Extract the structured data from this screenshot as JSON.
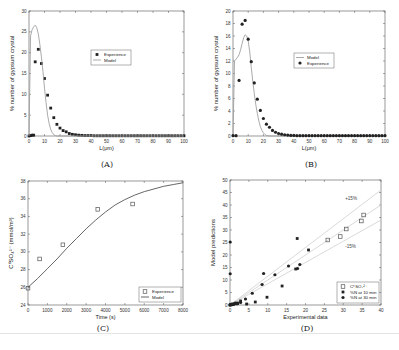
{
  "figure": {
    "captions": [
      "(A)",
      "(B)",
      "(C)",
      "(D)"
    ]
  },
  "chart_data": [
    {
      "id": "A",
      "type": "scatter",
      "title": "",
      "xlabel": "L(μm)",
      "ylabel": "% number of gypsum crystal",
      "xlim": [
        0,
        100
      ],
      "ylim": [
        0,
        30
      ],
      "xticks": [
        0,
        10,
        20,
        30,
        40,
        50,
        60,
        70,
        80,
        90,
        100
      ],
      "yticks": [
        0,
        5,
        10,
        15,
        20,
        25,
        30
      ],
      "grid": false,
      "legend": {
        "position": "center-right",
        "entries": [
          "Experience",
          "Model"
        ]
      },
      "series": [
        {
          "name": "Experience",
          "kind": "marker",
          "marker": "square",
          "x": [
            0,
            1,
            2,
            3,
            4,
            6,
            8,
            10,
            12,
            14,
            16,
            18,
            20,
            22,
            24,
            26,
            28,
            30,
            32,
            34,
            36,
            38,
            40,
            42,
            44,
            46,
            48,
            50,
            52,
            54,
            56,
            58,
            60,
            62,
            64,
            66,
            68,
            70,
            72,
            74,
            76,
            78,
            80,
            82,
            84,
            86,
            88,
            90,
            92,
            94,
            96,
            98,
            100
          ],
          "y": [
            0,
            0.1,
            0.2,
            0.2,
            17.8,
            20.8,
            17.4,
            13.8,
            9.8,
            6.7,
            4.4,
            2.8,
            1.9,
            1.3,
            1.0,
            0.6,
            0.4,
            0.3,
            0.2,
            0.15,
            0.1,
            0.1,
            0.1,
            0.05,
            0.05,
            0.05,
            0.05,
            0.05,
            0.05,
            0.05,
            0.05,
            0.05,
            0.05,
            0.05,
            0.05,
            0.05,
            0.05,
            0.05,
            0.05,
            0.05,
            0.05,
            0.05,
            0.05,
            0.05,
            0.05,
            0.05,
            0.05,
            0.05,
            0.05,
            0.05,
            0.05,
            0.05,
            0.05
          ]
        },
        {
          "name": "Model",
          "kind": "line",
          "x": [
            0,
            1,
            2,
            3,
            4,
            5,
            6,
            7,
            8,
            9,
            10,
            11,
            12,
            13,
            14,
            15,
            16,
            17,
            18,
            20,
            25,
            30,
            100
          ],
          "y": [
            0,
            24,
            25.5,
            26.2,
            26.6,
            26.0,
            24.5,
            22,
            19,
            15.5,
            11.5,
            8,
            5,
            3,
            1.6,
            0.8,
            0.3,
            0.1,
            0,
            0,
            0,
            0,
            0
          ]
        }
      ]
    },
    {
      "id": "B",
      "type": "scatter",
      "title": "",
      "xlabel": "L(μm)",
      "ylabel": "% number of gypsum crystal",
      "xlim": [
        0,
        100
      ],
      "ylim": [
        0,
        20
      ],
      "xticks": [
        0,
        10,
        20,
        30,
        40,
        50,
        60,
        70,
        80,
        90,
        100
      ],
      "yticks": [
        0,
        2,
        4,
        6,
        8,
        10,
        12,
        14,
        16,
        18,
        20
      ],
      "grid": false,
      "legend": {
        "position": "center-right",
        "entries": [
          "Model",
          "Experience"
        ]
      },
      "series": [
        {
          "name": "Model",
          "kind": "line",
          "x": [
            0,
            1,
            2,
            3,
            4,
            5,
            6,
            7,
            8,
            9,
            10,
            11,
            12,
            13,
            14,
            15,
            16,
            17,
            18,
            19,
            20,
            21,
            22,
            24,
            26,
            100
          ],
          "y": [
            0,
            12,
            12.3,
            12.6,
            13,
            13.8,
            14.8,
            15.7,
            16.2,
            16.0,
            15.2,
            13.5,
            11,
            8.8,
            6.8,
            5,
            3.6,
            2.4,
            1.5,
            0.9,
            0.5,
            0.25,
            0.1,
            0,
            0,
            0
          ]
        },
        {
          "name": "Experience",
          "kind": "marker",
          "marker": "diamond",
          "x": [
            0,
            2,
            4,
            6,
            8,
            10,
            12,
            14,
            16,
            18,
            20,
            22,
            24,
            26,
            28,
            30,
            32,
            34,
            36,
            38,
            40,
            42,
            44,
            46,
            48,
            50,
            52,
            54,
            56,
            58,
            60,
            62,
            64,
            66,
            68,
            70,
            72,
            74,
            76,
            78,
            80,
            82,
            84,
            86,
            88,
            90,
            92,
            94,
            96,
            98,
            100
          ],
          "y": [
            0.05,
            0.05,
            8.9,
            17.9,
            18.5,
            15.5,
            11.9,
            8.5,
            5.9,
            4.1,
            2.8,
            1.9,
            1.4,
            0.9,
            0.6,
            0.4,
            0.3,
            0.2,
            0.15,
            0.1,
            0.1,
            0.05,
            0.05,
            0.05,
            0.05,
            0.05,
            0.05,
            0.05,
            0.05,
            0.05,
            0.05,
            0.05,
            0.05,
            0.05,
            0.05,
            0.05,
            0.05,
            0.05,
            0.05,
            0.05,
            0.05,
            0.05,
            0.05,
            0.05,
            0.05,
            0.05,
            0.05,
            0.05,
            0.05,
            0.05,
            0.05
          ]
        }
      ]
    },
    {
      "id": "C",
      "type": "line",
      "title": "",
      "xlabel": "Time (s)",
      "ylabel": "C⁰SO₄²⁻ (mmol/m³)",
      "xlim": [
        0,
        8000
      ],
      "ylim": [
        24,
        38
      ],
      "xticks": [
        0,
        1000,
        2000,
        3000,
        4000,
        5000,
        6000,
        7000,
        8000
      ],
      "yticks": [
        24,
        26,
        28,
        30,
        32,
        34,
        36,
        38
      ],
      "grid": false,
      "legend": {
        "position": "lower-right",
        "entries": [
          "Experience",
          "Model"
        ]
      },
      "series": [
        {
          "name": "Experience",
          "kind": "marker",
          "marker": "open-square",
          "x": [
            0,
            600,
            1800,
            3600,
            5400
          ],
          "y": [
            25.9,
            29.2,
            30.8,
            34.8,
            35.4
          ]
        },
        {
          "name": "Model",
          "kind": "line",
          "x": [
            0,
            500,
            1000,
            1500,
            2000,
            2500,
            3000,
            3500,
            4000,
            4500,
            5000,
            5500,
            6000,
            6500,
            7000,
            7500,
            8000
          ],
          "y": [
            26.0,
            27.0,
            28.1,
            29.2,
            30.4,
            31.5,
            32.6,
            33.6,
            34.5,
            35.3,
            35.9,
            36.4,
            36.8,
            37.1,
            37.4,
            37.6,
            37.8
          ]
        }
      ]
    },
    {
      "id": "D",
      "type": "scatter",
      "title": "",
      "xlabel": "Experimental data",
      "ylabel": "Model predictions",
      "xlim": [
        0,
        40
      ],
      "ylim": [
        0,
        50
      ],
      "xticks": [
        0,
        5,
        10,
        15,
        20,
        25,
        30,
        35,
        40
      ],
      "yticks": [
        0,
        5,
        10,
        15,
        20,
        25,
        30,
        35,
        40,
        45,
        50
      ],
      "grid": false,
      "annotations": [
        {
          "text": "+15%",
          "x": 30.5,
          "y": 42
        },
        {
          "text": "-15%",
          "x": 30.5,
          "y": 23
        }
      ],
      "reference_lines": [
        {
          "name": "y=x",
          "slope": 1.0
        },
        {
          "name": "+15%",
          "slope": 1.15
        },
        {
          "name": "-15%",
          "slope": 0.85
        }
      ],
      "legend": {
        "position": "lower-right",
        "entries": [
          "C⁰SO₄²⁻",
          "%N at 10 min",
          "%N at 30 min"
        ]
      },
      "series": [
        {
          "name": "C⁰SO₄²⁻",
          "kind": "marker",
          "marker": "open-square",
          "x": [
            25.9,
            29.2,
            30.8,
            34.8,
            35.4
          ],
          "y": [
            26.0,
            27.4,
            30.4,
            33.6,
            36.0
          ]
        },
        {
          "name": "%N at 10 min",
          "kind": "marker",
          "marker": "square",
          "x": [
            0,
            0.2,
            0.4,
            0.6,
            0.8,
            1.0,
            1.5,
            2.0,
            2.8,
            4.4,
            6.7,
            9.8,
            13.8,
            17.4,
            17.8,
            20.8
          ],
          "y": [
            0,
            0.1,
            0.1,
            0.2,
            0.3,
            0.3,
            0.5,
            0.8,
            1.6,
            0.4,
            1.2,
            3.1,
            7.6,
            14.4,
            26.6,
            22.0
          ]
        },
        {
          "name": "%N at 30 min",
          "kind": "marker",
          "marker": "diamond",
          "x": [
            0,
            0.1,
            0.3,
            0.5,
            1.0,
            1.4,
            2.0,
            2.8,
            4.1,
            5.9,
            8.5,
            8.9,
            11.9,
            15.5,
            17.9,
            18.5,
            0.05,
            0.05
          ],
          "y": [
            0,
            0.2,
            0.3,
            0.4,
            0.5,
            0.8,
            0.5,
            1.0,
            2.4,
            4.7,
            8.2,
            12.6,
            12.1,
            15.6,
            14.6,
            16.2,
            12.5,
            25.2
          ]
        }
      ]
    }
  ]
}
